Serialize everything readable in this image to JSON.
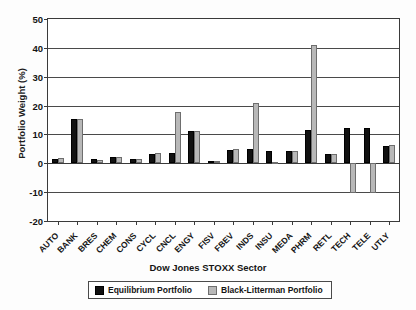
{
  "chart_data": {
    "type": "bar",
    "title": "",
    "xlabel": "Dow Jones STOXX Sector",
    "ylabel": "Portfolio Weight (%)",
    "ylim": [
      -20,
      50
    ],
    "yticks": [
      50,
      40,
      30,
      20,
      10,
      0,
      -10,
      -20
    ],
    "grid": true,
    "legend_position": "bottom",
    "categories": [
      "AUTO",
      "BANK",
      "BRES",
      "CHEM",
      "CONS",
      "CYCL",
      "CNCL",
      "ENGY",
      "FISV",
      "FBEV",
      "INDS",
      "INSU",
      "MEDA",
      "PHRM",
      "RETL",
      "TECH",
      "TELE",
      "UTLY"
    ],
    "series": [
      {
        "name": "Equilibrium Portfolio",
        "color": "#111111",
        "values": [
          1.6,
          15.3,
          1.4,
          2.3,
          1.4,
          3.3,
          3.5,
          11.2,
          0.7,
          4.7,
          4.8,
          4.2,
          4.3,
          11.4,
          3.1,
          12.1,
          12.1,
          5.9
        ]
      },
      {
        "name": "Black-Litterman Portfolio",
        "color": "#b8b8b8",
        "values": [
          1.7,
          15.3,
          1.2,
          2.2,
          1.4,
          3.4,
          17.7,
          11.2,
          0.9,
          4.9,
          20.9,
          0.5,
          4.4,
          41.0,
          3.2,
          -10.4,
          -10.4,
          6.4
        ]
      }
    ]
  },
  "legend": {
    "entries": [
      {
        "label": "Equilibrium Portfolio"
      },
      {
        "label": "Black-Litterman Portfolio"
      }
    ]
  }
}
